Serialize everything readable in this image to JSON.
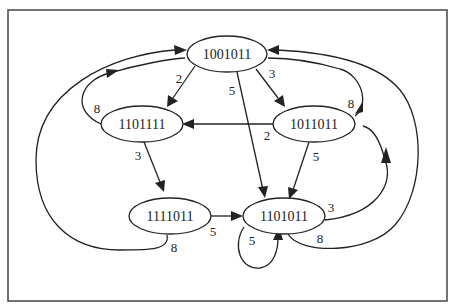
{
  "diagram": {
    "type": "directed-graph",
    "nodes": [
      {
        "id": "n1001011",
        "label": "1001011"
      },
      {
        "id": "n1101111",
        "label": "1101111"
      },
      {
        "id": "n1011011",
        "label": "1011011"
      },
      {
        "id": "n1111011",
        "label": "1111011"
      },
      {
        "id": "n1101011",
        "label": "1101011"
      }
    ],
    "edges": [
      {
        "from": "1001011",
        "to": "1101111",
        "label": "2"
      },
      {
        "from": "1001011",
        "to": "1011011",
        "label": "3"
      },
      {
        "from": "1001011",
        "to": "1101011",
        "label": "5"
      },
      {
        "from": "1101111",
        "to": "1001011",
        "label": "8"
      },
      {
        "from": "1101111",
        "to": "1111011",
        "label": "3"
      },
      {
        "from": "1011011",
        "to": "1101111",
        "label": "2"
      },
      {
        "from": "1011011",
        "to": "1001011",
        "label": "8"
      },
      {
        "from": "1011011",
        "to": "1101011",
        "label": "5"
      },
      {
        "from": "1111011",
        "to": "1101011",
        "label": "5"
      },
      {
        "from": "1111011",
        "to": "1001011",
        "label": "8"
      },
      {
        "from": "1101011",
        "to": "1101011",
        "label": "5"
      },
      {
        "from": "1101011",
        "to": "1011011",
        "label": "3"
      },
      {
        "from": "1101011",
        "to": "1001011",
        "label": "8"
      }
    ]
  }
}
